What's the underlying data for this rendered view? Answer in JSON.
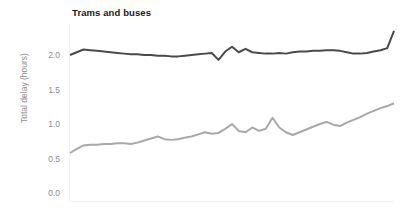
{
  "chart_data": {
    "type": "line",
    "title": "Trams and buses",
    "xlabel": "",
    "ylabel": "Total delay (hours)",
    "ylim": [
      0.0,
      2.45
    ],
    "yticks": [
      0.0,
      0.5,
      1.0,
      1.5,
      2.0
    ],
    "ytick_labels": [
      "0.0",
      "0.5",
      "1.0",
      "1.5",
      "2.0"
    ],
    "grid": false,
    "legend": "none",
    "xtick_labels": [],
    "x": [
      0,
      1,
      2,
      3,
      4,
      5,
      6,
      7,
      8,
      9,
      10,
      11,
      12,
      13,
      14,
      15,
      16,
      17,
      18,
      19,
      20,
      21,
      22,
      23,
      24,
      25,
      26,
      27,
      28,
      29,
      30,
      31,
      32,
      33,
      34,
      35,
      36,
      37,
      38,
      39,
      40,
      41,
      42,
      43,
      44,
      45,
      46,
      47,
      48
    ],
    "series": [
      {
        "name": "trams",
        "color": "#4a4a4a",
        "linewidth": 2.0,
        "values": [
          2.0,
          2.04,
          2.08,
          2.07,
          2.06,
          2.05,
          2.04,
          2.03,
          2.02,
          2.01,
          2.01,
          2.0,
          2.0,
          1.99,
          1.99,
          1.98,
          1.98,
          1.99,
          2.0,
          2.01,
          2.02,
          2.03,
          1.93,
          2.05,
          2.12,
          2.04,
          2.09,
          2.04,
          2.03,
          2.02,
          2.02,
          2.03,
          2.02,
          2.04,
          2.05,
          2.05,
          2.06,
          2.06,
          2.07,
          2.07,
          2.06,
          2.04,
          2.02,
          2.02,
          2.03,
          2.05,
          2.07,
          2.1,
          2.35
        ]
      },
      {
        "name": "buses",
        "color": "#a8a8a8",
        "linewidth": 2.0,
        "values": [
          0.58,
          0.64,
          0.69,
          0.7,
          0.7,
          0.71,
          0.71,
          0.72,
          0.72,
          0.71,
          0.73,
          0.76,
          0.79,
          0.82,
          0.78,
          0.77,
          0.78,
          0.8,
          0.82,
          0.85,
          0.88,
          0.86,
          0.87,
          0.93,
          1.0,
          0.9,
          0.88,
          0.95,
          0.9,
          0.93,
          1.09,
          0.95,
          0.88,
          0.84,
          0.88,
          0.92,
          0.96,
          1.0,
          1.03,
          0.99,
          0.97,
          1.02,
          1.06,
          1.1,
          1.15,
          1.19,
          1.23,
          1.26,
          1.3
        ]
      }
    ]
  },
  "axes": {
    "plot_left_px": 70,
    "plot_right_px": 394,
    "plot_top_px": 24,
    "plot_bottom_px": 201,
    "y_zero_px": 193,
    "y_unit_px": 69
  }
}
